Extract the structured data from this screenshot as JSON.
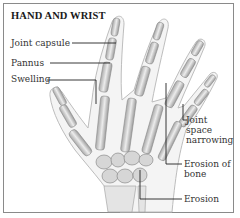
{
  "figure": {
    "title": "HAND AND WRIST",
    "labels": {
      "joint_capsule": "Joint capsule",
      "pannus": "Pannus",
      "swelling": "Swelling",
      "joint_space_1": "Joint",
      "joint_space_2": "space",
      "joint_space_3": "narrowing",
      "erosion_of_bone_1": "Erosion of",
      "erosion_of_bone_2": "bone",
      "erosion": "Erosion"
    },
    "colors": {
      "frame": "#8a8a8a",
      "leader": "#222222",
      "bone": "#d9d9d9",
      "tissue": "#b8b8b8"
    }
  }
}
